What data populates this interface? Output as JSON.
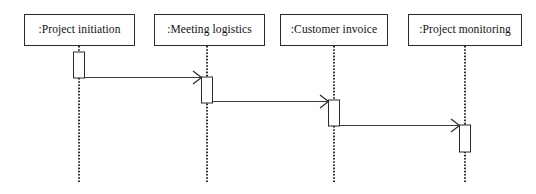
{
  "diagram": {
    "type": "uml-sequence-diagram",
    "title": "",
    "background_color": "#ffffff",
    "line_color": "#2b2b2b",
    "text_color": "#111111",
    "width": 536,
    "height": 194
  },
  "lifelines": [
    {
      "id": "project-initiation",
      "label": ":Project initiation",
      "box": {
        "x": 24,
        "y": 14,
        "width": 111,
        "height": 32
      },
      "axis_x": 79,
      "line_bottom_y": 183,
      "line_style": "dotted"
    },
    {
      "id": "meeting-logistics",
      "label": ":Meeting logistics",
      "box": {
        "x": 154,
        "y": 14,
        "width": 111,
        "height": 32
      },
      "axis_x": 207,
      "line_bottom_y": 183,
      "line_style": "dotted"
    },
    {
      "id": "customer-invoice",
      "label": ":Customer invoice",
      "box": {
        "x": 280,
        "y": 14,
        "width": 108,
        "height": 32
      },
      "axis_x": 334,
      "line_bottom_y": 183,
      "line_style": "dotted"
    },
    {
      "id": "project-monitoring",
      "label": ":Project monitoring",
      "box": {
        "x": 408,
        "y": 14,
        "width": 114,
        "height": 32
      },
      "axis_x": 465,
      "line_bottom_y": 183,
      "line_style": "dotted"
    }
  ],
  "activations": [
    {
      "id": "activation-project-initiation",
      "lifeline": "project-initiation",
      "x": 73.5,
      "y": 52,
      "width": 11,
      "height": 26
    },
    {
      "id": "activation-meeting-logistics",
      "lifeline": "meeting-logistics",
      "x": 201.5,
      "y": 77,
      "width": 11,
      "height": 26
    },
    {
      "id": "activation-customer-invoice",
      "lifeline": "customer-invoice",
      "x": 328.5,
      "y": 100,
      "width": 11,
      "height": 26
    },
    {
      "id": "activation-project-monitoring",
      "lifeline": "project-monitoring",
      "x": 459.5,
      "y": 125,
      "width": 11,
      "height": 27
    }
  ],
  "messages": [
    {
      "id": "message-initiation-to-logistics",
      "label": "",
      "from": "project-initiation",
      "to": "meeting-logistics",
      "x1": 84.5,
      "x2": 201.5,
      "y": 77.5,
      "arrow": "open",
      "line_style": "solid"
    },
    {
      "id": "message-logistics-to-invoice",
      "label": "",
      "from": "meeting-logistics",
      "to": "customer-invoice",
      "x1": 212.5,
      "x2": 328.5,
      "y": 101.5,
      "arrow": "open",
      "line_style": "solid"
    },
    {
      "id": "message-invoice-to-monitoring",
      "label": "",
      "from": "customer-invoice",
      "to": "project-monitoring",
      "x1": 339.5,
      "x2": 459.5,
      "y": 125.5,
      "arrow": "open",
      "line_style": "solid"
    }
  ]
}
